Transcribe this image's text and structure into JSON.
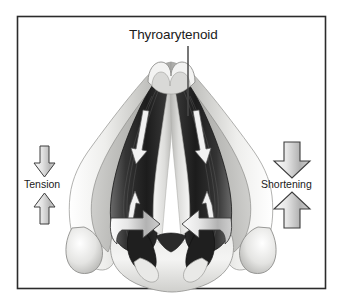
{
  "figure": {
    "kind": "anatomical-illustration",
    "border_color": "#2b2b2b",
    "background_color": "#ffffff",
    "title_label": "Thyroarytenoid",
    "left_label": "Tension",
    "right_label": "Shortening",
    "annotations": [
      {
        "name": "thyroarytenoid-leader",
        "text": "Thyroarytenoid",
        "points_to": "thyroarytenoid-muscle"
      },
      {
        "name": "tension-annotation",
        "text": "Tension",
        "arrow_style": "narrow",
        "directions": [
          "down",
          "up"
        ]
      },
      {
        "name": "shortening-annotation",
        "text": "Shortening",
        "arrow_style": "wide",
        "directions": [
          "down",
          "up"
        ]
      }
    ],
    "anatomy_parts": [
      "thyroid-cartilage",
      "thyroid-notch",
      "anterior-commissure",
      "thyroarytenoid-muscle",
      "vocal-fold",
      "arytenoid-cartilage",
      "cricoid-cartilage",
      "inferior-cornu"
    ],
    "muscle_action_arrows": {
      "name": "muscle-contraction-arrows",
      "color": "#f2f2f2",
      "count": 4,
      "directions": [
        "down",
        "up",
        "down",
        "up"
      ]
    },
    "medial_rotation_arrows": {
      "name": "arytenoid-rotation-arrows",
      "color": "#e8e8e8",
      "count": 2
    },
    "palette": {
      "outline": "#2f2f2f",
      "cartilage_light": "#f0f0ef",
      "cartilage_mid": "#c9c9c7",
      "cartilage_shadow": "#9a9a98",
      "muscle_dark": "#3a3a3a",
      "muscle_darkest": "#1e1e1e",
      "muscle_mid": "#5c5c5c",
      "arrow_fill_light": "#ededed",
      "arrow_fill_mid": "#bdbdbd",
      "arrow_outline": "#3a3a3a"
    }
  }
}
